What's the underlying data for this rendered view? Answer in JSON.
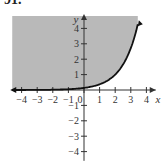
{
  "problem_number": "91.",
  "chart_data": {
    "type": "area",
    "title": "",
    "xlabel": "x",
    "ylabel": "y",
    "x_ticks": [
      -4,
      -3,
      -2,
      -1,
      0,
      1,
      2,
      3,
      4
    ],
    "y_ticks": [
      -4,
      -3,
      -2,
      -1,
      1,
      2,
      3,
      4
    ],
    "xlim": [
      -4.6,
      4.6
    ],
    "ylim": [
      -4.6,
      4.8
    ],
    "grid": false,
    "boundary_curve": "y = e^(x-2)",
    "shaded_region": "above curve",
    "points": [
      {
        "x": -4.5,
        "y": 0.0
      },
      {
        "x": -2,
        "y": 0.02
      },
      {
        "x": 0,
        "y": 0.14
      },
      {
        "x": 1,
        "y": 0.37
      },
      {
        "x": 2,
        "y": 1.0
      },
      {
        "x": 3,
        "y": 2.72
      },
      {
        "x": 3.5,
        "y": 4.48
      }
    ],
    "colors": {
      "shade": "#b9b9b9",
      "curve": "#111111",
      "axis": "#333333"
    }
  }
}
